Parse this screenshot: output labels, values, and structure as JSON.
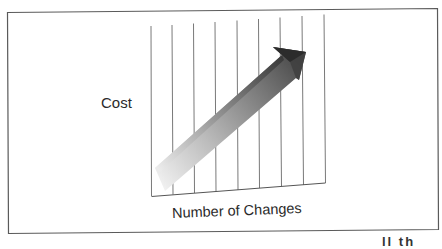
{
  "figure": {
    "y_axis_label": "Cost",
    "x_axis_label": "Number of Changes",
    "grid": {
      "vertical_lines": 9,
      "description": "perspective grid panel with vertical lines"
    },
    "arrow": {
      "direction": "up-right",
      "meaning": "cost rises as number of changes increases",
      "gradient_start": "#f2f2f2",
      "gradient_end": "#3a3a3a"
    },
    "colors": {
      "border": "#555555",
      "grid_line": "#666666",
      "text": "#2a2a2a"
    },
    "cutoff_text": "ll  th"
  }
}
